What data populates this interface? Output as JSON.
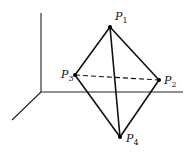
{
  "diagram": {
    "points": [
      {
        "id": "P1",
        "base": "P",
        "sub": "1",
        "x": 110,
        "y": 27
      },
      {
        "id": "P2",
        "base": "P",
        "sub": "2",
        "x": 159,
        "y": 80
      },
      {
        "id": "P3",
        "base": "P",
        "sub": "3",
        "x": 75,
        "y": 75
      },
      {
        "id": "P4",
        "base": "P",
        "sub": "4",
        "x": 120,
        "y": 137
      }
    ],
    "edges_solid": [
      [
        "P1",
        "P2"
      ],
      [
        "P1",
        "P3"
      ],
      [
        "P1",
        "P4"
      ],
      [
        "P2",
        "P4"
      ],
      [
        "P3",
        "P4"
      ]
    ],
    "edges_dashed": [
      [
        "P3",
        "P2"
      ]
    ],
    "axes": {
      "origin": [
        41,
        92
      ],
      "vertical_top": [
        41,
        13
      ],
      "horizontal_end": [
        183,
        92
      ],
      "diagonal_end": [
        12,
        120
      ]
    }
  }
}
